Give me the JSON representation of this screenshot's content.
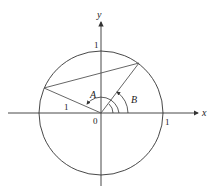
{
  "diagram": {
    "type": "unit-circle-angles",
    "axes": {
      "x_label": "x",
      "y_label": "y",
      "origin_label": "0"
    },
    "ticks": {
      "x_tick": "1",
      "y_tick": "1"
    },
    "segment_label": "1",
    "angles": [
      {
        "name": "A",
        "label": "A"
      },
      {
        "name": "B",
        "label": "B"
      }
    ],
    "colors": {
      "stroke": "#333333",
      "background": "#ffffff"
    }
  }
}
